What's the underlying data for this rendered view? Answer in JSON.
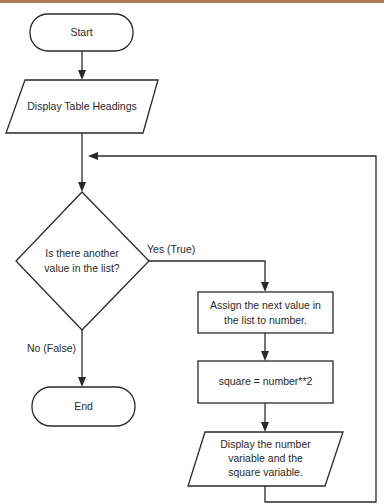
{
  "colors": {
    "top_border": "#b07a55",
    "stroke": "#2a2a2a",
    "background": "#ffffff"
  },
  "flowchart": {
    "start": {
      "label": "Start"
    },
    "display_headings": {
      "label": "Display Table Headings"
    },
    "decision": {
      "lines": [
        "Is there another",
        "value in the list?"
      ]
    },
    "yes_label": "Yes (True)",
    "no_label": "No (False)",
    "assign": {
      "lines": [
        "Assign the next value in",
        "the list to number."
      ]
    },
    "compute": {
      "label": "square = number**2"
    },
    "display_values": {
      "lines": [
        "Display the number",
        "variable and the",
        "square variable."
      ]
    },
    "end": {
      "label": "End"
    }
  }
}
